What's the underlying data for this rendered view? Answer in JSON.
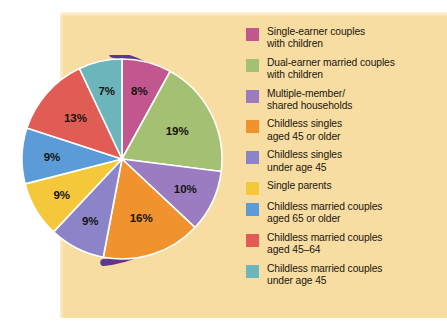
{
  "figure": {
    "panel_bg": "#f7dda1",
    "page_bg": "#ffffff",
    "rim_color": "#5b3a8e"
  },
  "chart_data": {
    "type": "pie",
    "title": "",
    "categories": [
      "Single-earner couples with children",
      "Dual-earner married couples with children",
      "Multiple-member/ shared households",
      "Childless singles aged 45 or older",
      "Childless singles under age 45",
      "Single parents",
      "Childless married couples aged 65 or older",
      "Childless married couples aged 45–64",
      "Childless married couples under age 45"
    ],
    "values": [
      8,
      19,
      10,
      16,
      9,
      9,
      9,
      13,
      7
    ],
    "value_labels": [
      "8%",
      "19%",
      "10%",
      "16%",
      "9%",
      "9%",
      "9%",
      "13%",
      "7%"
    ],
    "colors": [
      "#c2568f",
      "#a4c072",
      "#9b7cc0",
      "#f0922e",
      "#8b84c8",
      "#f5c83c",
      "#5b9bd8",
      "#e05c55",
      "#6bb5bb"
    ],
    "units": "percent",
    "total": 100,
    "legend_position": "right",
    "grid": false,
    "start_angle_deg": -90,
    "direction": "clockwise"
  },
  "legend": {
    "items": [
      {
        "color": "#c2568f",
        "line1": "Single-earner couples",
        "line2": "with children"
      },
      {
        "color": "#a4c072",
        "line1": "Dual-earner married couples",
        "line2": "with children"
      },
      {
        "color": "#9b7cc0",
        "line1": "Multiple-member/",
        "line2": "shared households"
      },
      {
        "color": "#f0922e",
        "line1": "Childless singles",
        "line2": "aged 45 or older"
      },
      {
        "color": "#8b84c8",
        "line1": "Childless singles",
        "line2": "under age 45"
      },
      {
        "color": "#f5c83c",
        "line1": "Single parents",
        "line2": ""
      },
      {
        "color": "#5b9bd8",
        "line1": "Childless married couples",
        "line2": "aged 65 or older"
      },
      {
        "color": "#e05c55",
        "line1": "Childless married couples",
        "line2": "aged 45–64"
      },
      {
        "color": "#6bb5bb",
        "line1": "Childless married couples",
        "line2": "under age 45"
      }
    ]
  }
}
